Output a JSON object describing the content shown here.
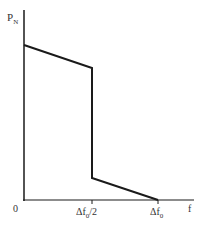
{
  "diagram": {
    "y_axis_label": "P",
    "y_axis_label_sub": "N",
    "x_axis_label": "f",
    "origin_label": "0",
    "ticks": [
      {
        "main": "Δf",
        "sub": "0",
        "suffix": "/2"
      },
      {
        "main": "Δf",
        "sub": "0",
        "suffix": ""
      }
    ],
    "curve_points": [
      [
        24,
        45
      ],
      [
        92,
        68
      ],
      [
        92,
        178
      ],
      [
        158,
        200
      ]
    ],
    "colors": {
      "line": "#1a1a1a",
      "text": "#333333"
    }
  }
}
